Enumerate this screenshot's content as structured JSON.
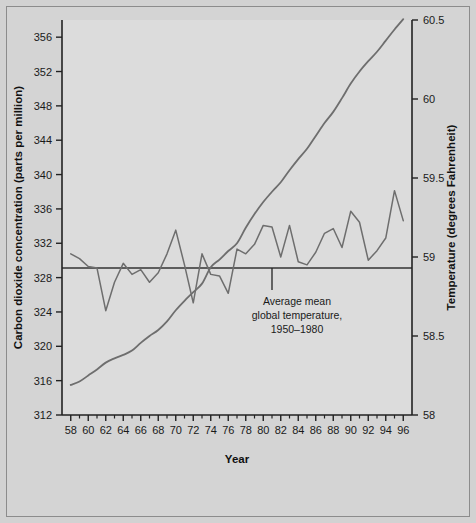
{
  "figure": {
    "background_color": "#d4d4d4",
    "plot_background_color": "#dcdcdc",
    "border_color": "#8c8c8c",
    "axis_color": "#222222",
    "series_color": "#6e6e6e",
    "reference_line_color": "#333333"
  },
  "chart_data": {
    "type": "line",
    "title": "",
    "xlabel": "Year",
    "ylabel": "Carbon dioxide concentration (parts per million)",
    "y2label": "Temperature (degrees Fahrenheit)",
    "grid": false,
    "legend_position": "none",
    "xlim": [
      57,
      97
    ],
    "ylim": [
      312,
      358
    ],
    "y2lim": [
      58,
      60.5
    ],
    "xticks": [
      58,
      60,
      62,
      64,
      66,
      68,
      70,
      72,
      74,
      76,
      78,
      80,
      82,
      84,
      86,
      88,
      90,
      92,
      94,
      96
    ],
    "xtick_labels": [
      "58",
      "60",
      "62",
      "64",
      "66",
      "68",
      "70",
      "72",
      "74",
      "76",
      "78",
      "80",
      "82",
      "84",
      "86",
      "88",
      "90",
      "92",
      "94",
      "96"
    ],
    "xminor_ticks": [
      59,
      61,
      63,
      65,
      67,
      69,
      71,
      73,
      75,
      77,
      79,
      81,
      83,
      85,
      87,
      89,
      91,
      93,
      95
    ],
    "yticks": [
      312,
      316,
      320,
      324,
      328,
      332,
      336,
      340,
      344,
      348,
      352,
      356
    ],
    "ytick_labels": [
      "312",
      "316",
      "320",
      "324",
      "328",
      "332",
      "336",
      "340",
      "344",
      "348",
      "352",
      "356"
    ],
    "y2ticks": [
      58,
      58.5,
      59,
      59.5,
      60,
      60.5
    ],
    "y2tick_labels": [
      "58",
      "58.5",
      "59",
      "59.5",
      "60",
      "60.5"
    ],
    "x": [
      58,
      59,
      60,
      61,
      62,
      63,
      64,
      65,
      66,
      67,
      68,
      69,
      70,
      71,
      72,
      73,
      74,
      75,
      76,
      77,
      78,
      79,
      80,
      81,
      82,
      83,
      84,
      85,
      86,
      87,
      88,
      89,
      90,
      91,
      92,
      93,
      94,
      95,
      96
    ],
    "series": [
      {
        "name": "Carbon dioxide concentration",
        "axis": "left",
        "units": "parts per million",
        "smooth": true,
        "values": [
          315.5,
          315.9,
          316.6,
          317.3,
          318.1,
          318.6,
          319.0,
          319.5,
          320.4,
          321.2,
          321.9,
          322.9,
          324.2,
          325.3,
          326.3,
          327.3,
          329.2,
          330.1,
          331.1,
          332.0,
          333.8,
          335.4,
          336.8,
          338.0,
          339.1,
          340.5,
          341.8,
          343.0,
          344.5,
          346.0,
          347.3,
          348.9,
          350.6,
          352.0,
          353.2,
          354.3,
          355.6,
          356.9,
          358.1
        ]
      },
      {
        "name": "Average global temperature",
        "axis": "right",
        "units": "degrees Fahrenheit",
        "smooth": false,
        "values": [
          59.02,
          58.99,
          58.94,
          58.93,
          58.66,
          58.84,
          58.96,
          58.89,
          58.92,
          58.84,
          58.9,
          59.02,
          59.17,
          58.95,
          58.71,
          59.02,
          58.89,
          58.88,
          58.77,
          59.05,
          59.02,
          59.08,
          59.2,
          59.19,
          59.0,
          59.2,
          58.97,
          58.95,
          59.03,
          59.15,
          59.18,
          59.06,
          59.29,
          59.22,
          58.98,
          59.04,
          59.12,
          59.42,
          59.23
        ]
      }
    ],
    "annotations": [
      {
        "name": "reference-line",
        "type": "hline",
        "axis": "right",
        "value": 58.93,
        "label_lines": [
          "Average mean",
          "global temperature,",
          "1950–1980"
        ],
        "leader_year": 81
      }
    ]
  }
}
